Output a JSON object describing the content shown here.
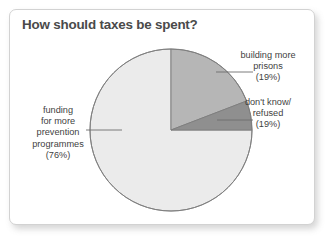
{
  "card": {
    "title": "How should taxes be spent?"
  },
  "chart_data": {
    "type": "pie",
    "title": "How should taxes be spent?",
    "xlabel": "",
    "ylabel": "",
    "grid": false,
    "legend_position": "callout-labels",
    "categories": [
      "funding for more prevention programmes",
      "building more prisons",
      "don't know/ refused"
    ],
    "values": [
      76,
      19,
      19
    ],
    "value_suffix": "%",
    "slices": [
      {
        "name": "funding-for-more-prevention-programmes",
        "label_lines": [
          "funding",
          "for more",
          "prevention",
          "programmes"
        ],
        "percent_label": "(76%)",
        "value": 76,
        "color": "#ebebeb",
        "geometry_sweep_deg": 270.0,
        "start_angle_deg": 90.0
      },
      {
        "name": "building-more-prisons",
        "label_lines": [
          "building more",
          "prisons"
        ],
        "percent_label": "(19%)",
        "value": 19,
        "color": "#b6b6b6",
        "geometry_sweep_deg": 69.0,
        "start_angle_deg": 0.0
      },
      {
        "name": "dont-know-refused",
        "label_lines": [
          "don't know/",
          "refused"
        ],
        "percent_label": "(19%)",
        "value": 19,
        "color": "#8f8f8f",
        "geometry_sweep_deg": 21.0,
        "start_angle_deg": 69.0
      }
    ],
    "colors": {
      "slice_light": "#ebebeb",
      "slice_medium": "#b6b6b6",
      "slice_dark": "#8f8f8f",
      "slice_outline": "#7d7d7d",
      "leader_line": "#6e6e6e",
      "title_text": "#4a4a4a",
      "label_text": "#3f3f3f",
      "card_border": "#d2d2d2",
      "card_background": "#ffffff"
    },
    "center": {
      "x": 161,
      "y": 120
    },
    "radius": 81
  }
}
